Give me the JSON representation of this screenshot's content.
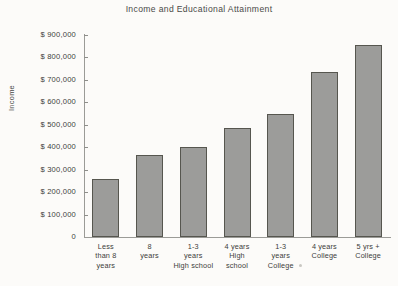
{
  "chart_data": {
    "type": "bar",
    "title": "Income and Educational Attainment",
    "xlabel": "",
    "ylabel": "Income",
    "categories": [
      "Less than 8 years",
      "8 years",
      "1-3 years High school",
      "4 years High school",
      "1-3 years College",
      "4 years College",
      "5 yrs + College"
    ],
    "category_lines": [
      [
        "Less",
        "than 8",
        "years"
      ],
      [
        "8",
        "years"
      ],
      [
        "1-3",
        "years",
        "High school"
      ],
      [
        "4 years",
        "High",
        "school"
      ],
      [
        "1-3",
        "years",
        "College"
      ],
      [
        "4 years",
        "College"
      ],
      [
        "5 yrs +",
        "College"
      ]
    ],
    "values": [
      260000,
      365000,
      400000,
      487000,
      550000,
      735000,
      855000
    ],
    "ylim": [
      0,
      900000
    ],
    "ytick_values": [
      0,
      100000,
      200000,
      300000,
      400000,
      500000,
      600000,
      700000,
      800000,
      900000
    ],
    "ytick_labels": [
      "0",
      "$  100,000",
      "$  200,000",
      "$  300,000",
      "$  400,000",
      "$  500,000",
      "$  600,000",
      "$  700,000",
      "$  800,000",
      "$  900,000"
    ],
    "grid": false,
    "legend": null,
    "bar_color": "#9c9c9a",
    "bar_edge_color": "#56564f",
    "axis_color": "#9b9b97",
    "background": "#fcfbf9"
  }
}
